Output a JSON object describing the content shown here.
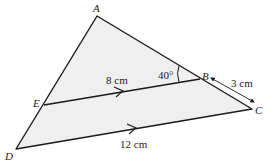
{
  "figure": {
    "points": {
      "A": {
        "label": "A",
        "x": 97,
        "y": 16
      },
      "B": {
        "label": "B",
        "x": 200,
        "y": 79
      },
      "C": {
        "label": "C",
        "x": 252,
        "y": 109
      },
      "D": {
        "label": "D",
        "x": 16,
        "y": 149
      },
      "E": {
        "label": "E",
        "x": 44,
        "y": 105
      }
    },
    "measurements": {
      "EB": "8 cm",
      "DC": "12 cm",
      "BC": "3 cm",
      "angle_ABE": "40°"
    },
    "colors": {
      "fill": "#efefef",
      "stroke": "#1a1a1a"
    }
  }
}
